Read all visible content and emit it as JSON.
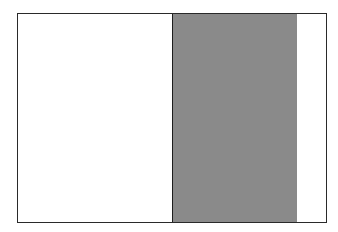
{
  "diagram": {
    "type": "rectangle-partition",
    "frame": {
      "x": 17,
      "y": 13,
      "width": 308,
      "height": 208,
      "border_color": "#2a2a2a",
      "fill": "#ffffff"
    },
    "divider": {
      "x_offset": 154,
      "color": "#1e1e1e"
    },
    "shaded_region": {
      "x_offset": 154,
      "width": 125,
      "color": "#8a8a8a"
    },
    "regions": [
      {
        "name": "left-region",
        "fill": "#ffffff"
      },
      {
        "name": "shaded-region",
        "fill": "#8a8a8a"
      },
      {
        "name": "right-strip",
        "fill": "#ffffff"
      }
    ]
  }
}
